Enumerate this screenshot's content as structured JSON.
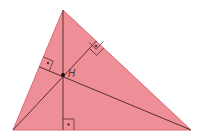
{
  "diagram": {
    "colors": {
      "fill": "#EE8E96",
      "edge": "#D86A75",
      "altitude": "#5A2E34",
      "marker": "#5A2E34",
      "background": "#FFFFFF"
    },
    "vertices": {
      "A": [
        13,
        130
      ],
      "B": [
        191,
        130
      ],
      "C": [
        63,
        10
      ]
    },
    "orthocenter": {
      "label": "H",
      "point": [
        63,
        75
      ]
    },
    "altitude_feet": {
      "from_C": [
        63,
        130
      ],
      "from_A": [
        96.3,
        41.2
      ],
      "from_B": [
        39.3,
        66.8
      ]
    },
    "right_angle_markers": 3
  }
}
